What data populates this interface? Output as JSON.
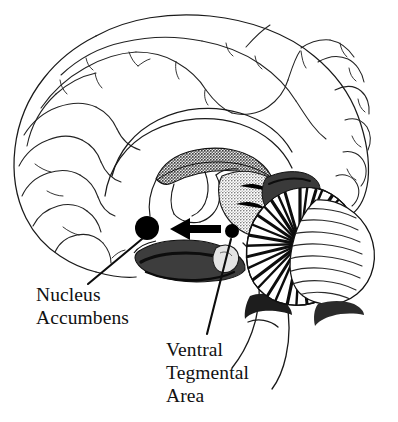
{
  "figure": {
    "kind": "anatomical-diagram",
    "background_color": "#ffffff",
    "ink_color": "#111111"
  },
  "labels": {
    "nucleus_accumbens": {
      "name": "Nucleus Accumbens",
      "lines": [
        "Nucleus",
        "Accumbens"
      ]
    },
    "ventral_tegmental_area": {
      "name": "Ventral Tegmental Area",
      "lines": [
        "Ventral",
        "Tegmental",
        "Area"
      ]
    }
  },
  "markers": {
    "nucleus_accumbens_dot": {
      "shape": "filled-circle",
      "color": "#000000",
      "cx": 147,
      "cy": 228,
      "r": 12
    },
    "ventral_tegmental_area_dot": {
      "shape": "filled-circle",
      "color": "#000000",
      "cx": 232,
      "cy": 231,
      "r": 7
    },
    "projection_arrow": {
      "shape": "arrow",
      "direction": "left",
      "from": "ventral_tegmental_area_dot",
      "to": "nucleus_accumbens_dot",
      "color": "#000000",
      "tail_x": 221,
      "head_x": 172,
      "y": 229
    }
  },
  "leaders": {
    "nucleus_accumbens_leader": {
      "x1": 142,
      "y1": 239,
      "x2": 88,
      "y2": 284
    },
    "ventral_tegmental_area_leader": {
      "x1": 231,
      "y1": 239,
      "x2": 207,
      "y2": 334
    }
  },
  "structures": [
    {
      "id": "cerebral-cortex",
      "label": "cerebral cortex outline with gyri and sulci",
      "fill": "none",
      "stroke": "#1a1a1a"
    },
    {
      "id": "corpus-callosum",
      "label": "corpus callosum",
      "fill": "#b9b9b9",
      "stroke": "#1a1a1a"
    },
    {
      "id": "thalamus",
      "label": "thalamus",
      "fill": "#8c8c8c",
      "stroke": "#1a1a1a"
    },
    {
      "id": "hypothalamus-midbrain",
      "label": "hypothalamus and midbrain",
      "fill": "#4a4a4a",
      "stroke": "#111111"
    },
    {
      "id": "cerebellum",
      "label": "cerebellum with arbor vitae",
      "fill": "#ffffff",
      "stroke": "#111111"
    },
    {
      "id": "brainstem",
      "label": "pons and medulla oblongata",
      "fill": "#ffffff",
      "stroke": "#1a1a1a"
    }
  ]
}
